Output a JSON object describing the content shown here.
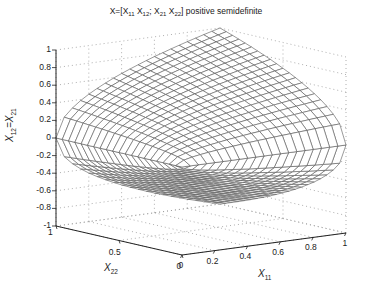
{
  "chart_data": {
    "type": "surface3d",
    "title": "X=[X11 X12; X21 X22] positive semidefinite",
    "title_parts": {
      "prefix": "X=[X",
      "s1": "11",
      "p2": " X",
      "s2": "12",
      "p3": "; X",
      "s3": "21",
      "p4": " X",
      "s4": "22",
      "suffix": "] positive semidefinite"
    },
    "xlabel": {
      "base": "X",
      "sub": "11"
    },
    "ylabel": {
      "base": "X",
      "sub": "22"
    },
    "zlabel": {
      "base": "X",
      "sub": "12",
      "mid": "=X",
      "sub2": "21"
    },
    "xlim": [
      0,
      1
    ],
    "ylim": [
      0,
      1
    ],
    "zlim": [
      -1,
      1
    ],
    "xticks": [
      "0",
      "0.2",
      "0.4",
      "0.6",
      "0.8",
      "1"
    ],
    "yticks": [
      "0",
      "0.5",
      "1"
    ],
    "zticks": [
      "1",
      "0.8",
      "0.6",
      "0.4",
      "0.2",
      "0",
      "-0.2",
      "-0.4",
      "-0.6",
      "-0.8",
      "-1"
    ],
    "grid": true,
    "surface": "X12 = ±sqrt(X11·X22), X11 in [0,1], X22 in [0,1]",
    "mesh_resolution": 20,
    "colors": {
      "mesh": "#555555",
      "face": "#ffffff",
      "axis": "#222222",
      "grid": "#9a9a9a"
    }
  }
}
